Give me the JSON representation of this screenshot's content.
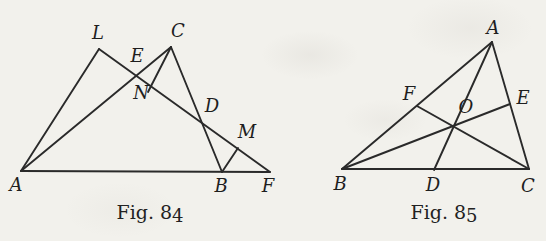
{
  "page": {
    "background_color": "#f2f1ec",
    "ink_color": "#2a2a2a"
  },
  "figures": [
    {
      "id": "fig84",
      "description": "triangle-with-transversal-diagram",
      "caption": {
        "prefix": "Fig. 8",
        "digit": "4"
      },
      "points": {
        "A": [
          21,
          171
        ],
        "L": [
          99,
          49
        ],
        "C": [
          171,
          47
        ],
        "E": [
          136,
          76
        ],
        "N": [
          148,
          92
        ],
        "D": [
          202,
          123
        ],
        "M": [
          238,
          148
        ],
        "B": [
          222,
          172
        ],
        "F": [
          270,
          172
        ]
      },
      "segments": [
        [
          "A",
          "L"
        ],
        [
          "A",
          "C"
        ],
        [
          "A",
          "F"
        ],
        [
          "L",
          "F"
        ],
        [
          "C",
          "B"
        ],
        [
          "C",
          "N"
        ],
        [
          "B",
          "M"
        ]
      ],
      "labels": [
        {
          "text": "A",
          "x": 16,
          "y": 191
        },
        {
          "text": "L",
          "x": 98,
          "y": 39
        },
        {
          "text": "C",
          "x": 178,
          "y": 37
        },
        {
          "text": "E",
          "x": 137,
          "y": 62
        },
        {
          "text": "N",
          "x": 141,
          "y": 99
        },
        {
          "text": "D",
          "x": 212,
          "y": 112
        },
        {
          "text": "M",
          "x": 247,
          "y": 138
        },
        {
          "text": "B",
          "x": 221,
          "y": 192
        },
        {
          "text": "F",
          "x": 268,
          "y": 192
        }
      ]
    },
    {
      "id": "fig85",
      "description": "triangle-with-concurrent-cevians-diagram",
      "caption": {
        "prefix": "Fig. 8",
        "digit": "5"
      },
      "points": {
        "A": [
          492,
          42
        ],
        "B": [
          342,
          169
        ],
        "C": [
          529,
          169
        ],
        "D": [
          434,
          170
        ],
        "E": [
          510,
          104
        ],
        "F": [
          417,
          106
        ],
        "O": [
          454,
          126
        ]
      },
      "segments": [
        [
          "B",
          "C"
        ],
        [
          "A",
          "B"
        ],
        [
          "A",
          "C"
        ],
        [
          "A",
          "D"
        ],
        [
          "B",
          "E"
        ],
        [
          "C",
          "F"
        ]
      ],
      "labels": [
        {
          "text": "A",
          "x": 493,
          "y": 34
        },
        {
          "text": "B",
          "x": 340,
          "y": 190
        },
        {
          "text": "C",
          "x": 528,
          "y": 192
        },
        {
          "text": "D",
          "x": 433,
          "y": 191
        },
        {
          "text": "E",
          "x": 523,
          "y": 104
        },
        {
          "text": "F",
          "x": 409,
          "y": 100
        },
        {
          "text": "O",
          "x": 466,
          "y": 113
        }
      ]
    }
  ]
}
